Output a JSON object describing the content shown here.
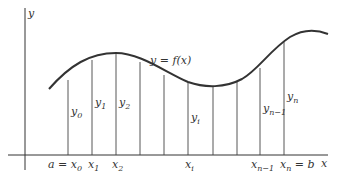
{
  "diagram": {
    "axes": {
      "x_label": "x",
      "y_label": "y"
    },
    "curve_label": "y = f(x)",
    "ordinate_labels": [
      {
        "base": "y",
        "sub": "0"
      },
      {
        "base": "y",
        "sub": "1"
      },
      {
        "base": "y",
        "sub": "2"
      },
      {
        "base": "y",
        "sub": "i"
      },
      {
        "base": "y",
        "sub": "n−1"
      },
      {
        "base": "y",
        "sub": "n"
      }
    ],
    "abscissa_labels": [
      {
        "prefix": "a = ",
        "base": "x",
        "sub": "0",
        "suffix": ""
      },
      {
        "prefix": "",
        "base": "x",
        "sub": "1",
        "suffix": ""
      },
      {
        "prefix": "",
        "base": "x",
        "sub": "2",
        "suffix": ""
      },
      {
        "prefix": "",
        "base": "x",
        "sub": "i",
        "suffix": ""
      },
      {
        "prefix": "",
        "base": "x",
        "sub": "n−1",
        "suffix": ""
      },
      {
        "prefix": "",
        "base": "x",
        "sub": "n",
        "suffix": " = b"
      }
    ],
    "ordinate_x_positions": [
      68,
      92,
      116,
      140,
      164,
      188,
      213,
      237,
      260,
      284
    ],
    "colors": {
      "stroke": "#333333",
      "background": "#ffffff"
    }
  }
}
